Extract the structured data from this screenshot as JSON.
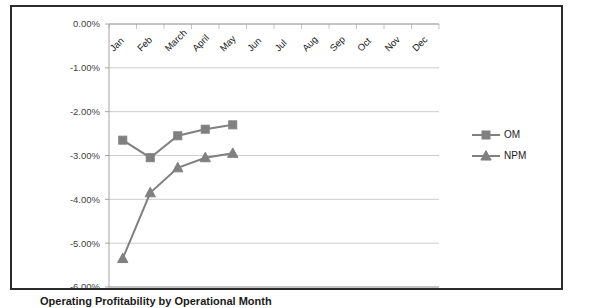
{
  "caption": "Operating Profitability by Operational Month",
  "chart_data": {
    "type": "line",
    "title": "",
    "subtitle": "",
    "xlabel": "",
    "ylabel": "",
    "categories": [
      "Jan",
      "Feb",
      "March",
      "April",
      "May",
      "Jun",
      "Jul",
      "Aug",
      "Sep",
      "Oct",
      "Nov",
      "Dec"
    ],
    "ytick_labels": [
      "0.00%",
      "-1.00%",
      "-2.00%",
      "-3.00%",
      "-4.00%",
      "-5.00%",
      "-6.00%"
    ],
    "ytick_values": [
      0,
      -1,
      -2,
      -3,
      -4,
      -5,
      -6
    ],
    "ylim": [
      -6,
      0
    ],
    "grid": true,
    "legend_position": "right",
    "series": [
      {
        "name": "OM",
        "marker": "square",
        "color": "#808080",
        "values": [
          -2.65,
          -3.05,
          -2.55,
          -2.4,
          -2.3,
          null,
          null,
          null,
          null,
          null,
          null,
          null
        ]
      },
      {
        "name": "NPM",
        "marker": "triangle",
        "color": "#808080",
        "values": [
          -5.35,
          -3.85,
          -3.28,
          -3.05,
          -2.95,
          null,
          null,
          null,
          null,
          null,
          null,
          null
        ]
      }
    ]
  },
  "colors": {
    "series": "#808080",
    "gridline": "#bfbfbf",
    "axis": "#9a9a9a",
    "frame_border": "#2b2b2b",
    "text": "#1a1a1a"
  }
}
